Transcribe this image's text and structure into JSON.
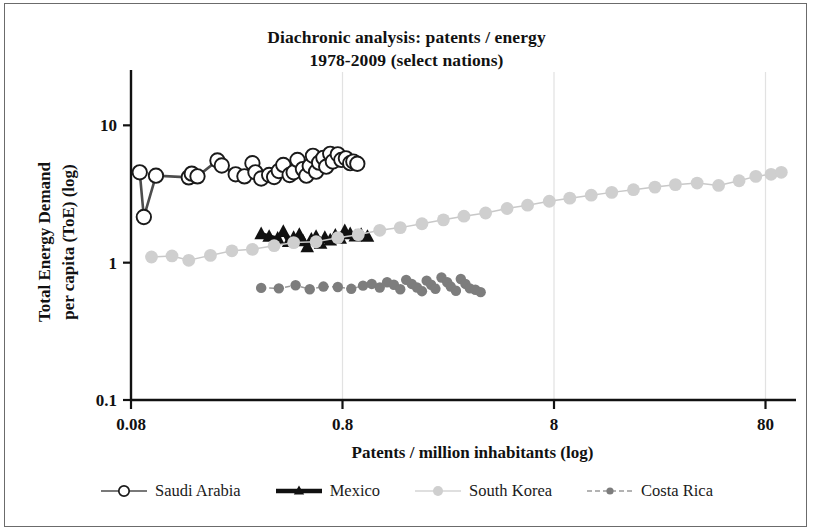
{
  "chart_data": {
    "type": "scatter",
    "title": "Diachronic analysis: patents / energy",
    "subtitle": "1978-2009  (select nations)",
    "xlabel": "Patents / million inhabitants (log)",
    "ylabel_line1": "Total Energy Demand",
    "ylabel_line2": "per capita (ToE) (log)",
    "xscale": "log",
    "yscale": "log",
    "xlim": [
      0.08,
      100
    ],
    "ylim": [
      0.1,
      20
    ],
    "xticks": [
      0.08,
      0.8,
      8,
      80
    ],
    "xtick_labels": [
      "0.08",
      "0.8",
      "8",
      "80"
    ],
    "yticks": [
      0.1,
      1,
      10
    ],
    "ytick_labels": [
      "0.1",
      "1",
      "10"
    ],
    "grid": "vertical-only-faint",
    "legend_position": "bottom",
    "series": [
      {
        "name": "Saudi Arabia",
        "marker": "open-circle",
        "color": "#1a1a1a",
        "marker_fill": "#ffffff",
        "line_color": "#4d4d4d",
        "points": [
          [
            0.088,
            4.55
          ],
          [
            0.092,
            2.15
          ],
          [
            0.105,
            4.3
          ],
          [
            0.15,
            4.18
          ],
          [
            0.155,
            4.45
          ],
          [
            0.165,
            4.25
          ],
          [
            0.205,
            5.55
          ],
          [
            0.215,
            5.1
          ],
          [
            0.25,
            4.4
          ],
          [
            0.275,
            4.25
          ],
          [
            0.3,
            5.3
          ],
          [
            0.31,
            4.55
          ],
          [
            0.33,
            4.1
          ],
          [
            0.36,
            4.35
          ],
          [
            0.38,
            4.2
          ],
          [
            0.4,
            4.65
          ],
          [
            0.42,
            5.15
          ],
          [
            0.45,
            4.35
          ],
          [
            0.47,
            4.55
          ],
          [
            0.49,
            5.6
          ],
          [
            0.52,
            4.8
          ],
          [
            0.54,
            4.3
          ],
          [
            0.56,
            5.05
          ],
          [
            0.58,
            6.0
          ],
          [
            0.6,
            4.6
          ],
          [
            0.62,
            5.35
          ],
          [
            0.65,
            5.8
          ],
          [
            0.67,
            5.0
          ],
          [
            0.7,
            6.2
          ],
          [
            0.72,
            5.45
          ],
          [
            0.76,
            6.15
          ],
          [
            0.79,
            5.6
          ],
          [
            0.83,
            5.75
          ],
          [
            0.87,
            5.3
          ],
          [
            0.9,
            5.45
          ],
          [
            0.94,
            5.25
          ]
        ]
      },
      {
        "name": "Mexico",
        "marker": "triangle",
        "color": "#111111",
        "line_color": "#111111",
        "points": [
          [
            0.33,
            1.62
          ],
          [
            0.36,
            1.55
          ],
          [
            0.395,
            1.5
          ],
          [
            0.42,
            1.68
          ],
          [
            0.445,
            1.42
          ],
          [
            0.47,
            1.52
          ],
          [
            0.5,
            1.6
          ],
          [
            0.52,
            1.44
          ],
          [
            0.545,
            1.3
          ],
          [
            0.57,
            1.48
          ],
          [
            0.6,
            1.55
          ],
          [
            0.63,
            1.38
          ],
          [
            0.66,
            1.52
          ],
          [
            0.7,
            1.46
          ],
          [
            0.74,
            1.58
          ],
          [
            0.78,
            1.5
          ],
          [
            0.82,
            1.7
          ],
          [
            0.87,
            1.62
          ],
          [
            0.92,
            1.56
          ],
          [
            0.98,
            1.6
          ],
          [
            1.05,
            1.55
          ]
        ]
      },
      {
        "name": "South Korea",
        "marker": "filled-circle-light",
        "color": "#cccccc",
        "line_color": "#c8c8c8",
        "points": [
          [
            0.1,
            1.1
          ],
          [
            0.125,
            1.12
          ],
          [
            0.15,
            1.04
          ],
          [
            0.19,
            1.13
          ],
          [
            0.24,
            1.22
          ],
          [
            0.3,
            1.25
          ],
          [
            0.38,
            1.33
          ],
          [
            0.47,
            1.4
          ],
          [
            0.6,
            1.42
          ],
          [
            0.76,
            1.52
          ],
          [
            0.95,
            1.6
          ],
          [
            1.2,
            1.72
          ],
          [
            1.5,
            1.8
          ],
          [
            1.9,
            1.92
          ],
          [
            2.4,
            2.05
          ],
          [
            3.0,
            2.18
          ],
          [
            3.8,
            2.3
          ],
          [
            4.8,
            2.48
          ],
          [
            6.0,
            2.62
          ],
          [
            7.6,
            2.8
          ],
          [
            9.5,
            2.95
          ],
          [
            12.0,
            3.1
          ],
          [
            15.0,
            3.25
          ],
          [
            19.0,
            3.4
          ],
          [
            24.0,
            3.55
          ],
          [
            30.0,
            3.7
          ],
          [
            38.0,
            3.8
          ],
          [
            48.0,
            3.65
          ],
          [
            60.0,
            3.95
          ],
          [
            72.0,
            4.25
          ],
          [
            85.0,
            4.4
          ],
          [
            95.0,
            4.55
          ]
        ]
      },
      {
        "name": "Costa Rica",
        "marker": "filled-circle-dark",
        "color": "#808080",
        "line_color": "#9a9a9a",
        "line_style": "dashed",
        "points": [
          [
            0.33,
            0.655
          ],
          [
            0.4,
            0.65
          ],
          [
            0.48,
            0.685
          ],
          [
            0.56,
            0.64
          ],
          [
            0.65,
            0.67
          ],
          [
            0.76,
            0.665
          ],
          [
            0.88,
            0.645
          ],
          [
            1.0,
            0.68
          ],
          [
            1.1,
            0.7
          ],
          [
            1.2,
            0.66
          ],
          [
            1.3,
            0.72
          ],
          [
            1.4,
            0.69
          ],
          [
            1.5,
            0.64
          ],
          [
            1.6,
            0.75
          ],
          [
            1.7,
            0.7
          ],
          [
            1.8,
            0.66
          ],
          [
            1.9,
            0.62
          ],
          [
            2.0,
            0.74
          ],
          [
            2.1,
            0.69
          ],
          [
            2.2,
            0.645
          ],
          [
            2.35,
            0.78
          ],
          [
            2.5,
            0.72
          ],
          [
            2.6,
            0.67
          ],
          [
            2.75,
            0.625
          ],
          [
            2.9,
            0.76
          ],
          [
            3.05,
            0.7
          ],
          [
            3.2,
            0.65
          ],
          [
            3.4,
            0.635
          ],
          [
            3.6,
            0.61
          ]
        ]
      }
    ]
  },
  "legend": {
    "items": [
      {
        "label": "Saudi Arabia",
        "key": "open-circle-line"
      },
      {
        "label": "Mexico",
        "key": "triangle-thick-line"
      },
      {
        "label": "South Korea",
        "key": "light-circle-line"
      },
      {
        "label": "Costa Rica",
        "key": "dark-circle-dashed-line"
      }
    ]
  }
}
